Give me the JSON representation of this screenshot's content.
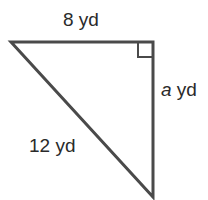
{
  "diagram": {
    "type": "right-triangle",
    "labels": {
      "top_side": "8 yd",
      "right_side_var": "a",
      "right_side_unit": " yd",
      "hypotenuse": "12 yd"
    },
    "colors": {
      "stroke": "#4a4a4a",
      "text": "#2a2a2a",
      "background": "#ffffff"
    }
  }
}
